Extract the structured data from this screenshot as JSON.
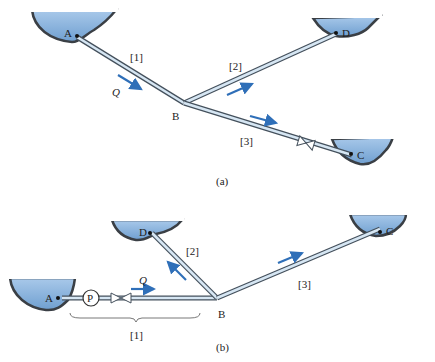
{
  "colors": {
    "water": "#8fb6e0",
    "water_dark": "#6f9fd0",
    "ground": "#3a3f45",
    "pipe_fill": "#d6e6f3",
    "pipe_edge": "#44505c",
    "arrow": "#2f6fb8",
    "text": "#222222"
  },
  "figure_a": {
    "caption": "(a)",
    "points": {
      "A": "A",
      "B": "B",
      "C": "C",
      "D": "D"
    },
    "pipes": {
      "p1": "[1]",
      "p2": "[2]",
      "p3": "[3]"
    },
    "flow_label": "Q"
  },
  "figure_b": {
    "caption": "(b)",
    "points": {
      "A": "A",
      "B": "B",
      "C": "C",
      "D": "D"
    },
    "pipes": {
      "p1": "[1]",
      "p2": "[2]",
      "p3": "[3]"
    },
    "flow_label": "Q",
    "pump_label": "P"
  }
}
